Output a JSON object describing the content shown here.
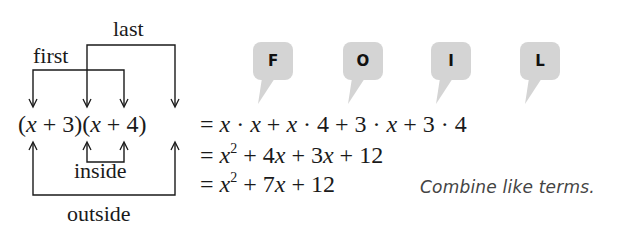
{
  "labels": {
    "last": "last",
    "first": "first",
    "inside": "inside",
    "outside": "outside"
  },
  "expression": {
    "left_side": "(x + 3)(x + 4)",
    "line1": "x · x + x · 4 + 3 · x + 3 · 4",
    "line2": "x² + 4x + 3x + 12",
    "line3": "x² + 7x + 12"
  },
  "foil": {
    "bubbles": [
      {
        "letter": "F",
        "meaning": "first"
      },
      {
        "letter": "O",
        "meaning": "outside"
      },
      {
        "letter": "I",
        "meaning": "inside"
      },
      {
        "letter": "L",
        "meaning": "last"
      }
    ],
    "bubble_color": "#d4d4d4"
  },
  "note": "Combine like terms."
}
